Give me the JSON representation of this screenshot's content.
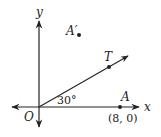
{
  "diagram": {
    "type": "coordinate-geometry",
    "axes": {
      "x_label": "x",
      "y_label": "y",
      "origin_label": "O"
    },
    "points": [
      {
        "id": "A",
        "label": "A",
        "coords_label": "(8, 0)"
      },
      {
        "id": "A_prime",
        "label": "A′"
      },
      {
        "id": "T",
        "label": "T"
      }
    ],
    "angle": {
      "label": "30°",
      "between": [
        "x-axis",
        "ray OT"
      ]
    },
    "colors": {
      "line": "#222222",
      "background": "#ffffff"
    }
  }
}
